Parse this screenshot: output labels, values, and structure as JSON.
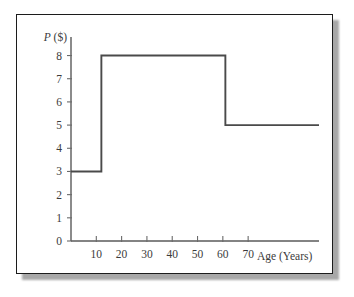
{
  "figure": {
    "frame_border_color": "#1c1c1c",
    "shadow_color": "#9a9a9a",
    "background_color": "#ffffff"
  },
  "chart_data": {
    "type": "line",
    "subtype": "step",
    "title": "",
    "subtitle": "",
    "xlabel": "Age (Years)",
    "ylabel": "P ($)",
    "ylabel_symbol": "P",
    "ylabel_unit": "($)",
    "xlim": [
      0,
      98
    ],
    "ylim": [
      0,
      8.8
    ],
    "grid": false,
    "legend": false,
    "legend_position": "none",
    "line_color": "#4a4a4a",
    "axis_color": "#5a5a5a",
    "x_ticks": [
      10,
      20,
      30,
      40,
      50,
      60,
      70
    ],
    "x_tick_labels": [
      "10",
      "20",
      "30",
      "40",
      "50",
      "60",
      "70"
    ],
    "y_ticks": [
      0,
      1,
      2,
      3,
      4,
      5,
      6,
      7,
      8
    ],
    "y_tick_labels": [
      "0",
      "1",
      "2",
      "3",
      "4",
      "5",
      "6",
      "7",
      "8"
    ],
    "steps": [
      {
        "x_start": 0,
        "x_end": 12,
        "value": 3
      },
      {
        "x_start": 12,
        "x_end": 61,
        "value": 8
      },
      {
        "x_start": 61,
        "x_end": 98,
        "value": 5
      }
    ],
    "x": [
      0,
      12,
      12,
      61,
      61,
      98
    ],
    "y": [
      3,
      3,
      8,
      8,
      5,
      5
    ],
    "annotations": []
  }
}
